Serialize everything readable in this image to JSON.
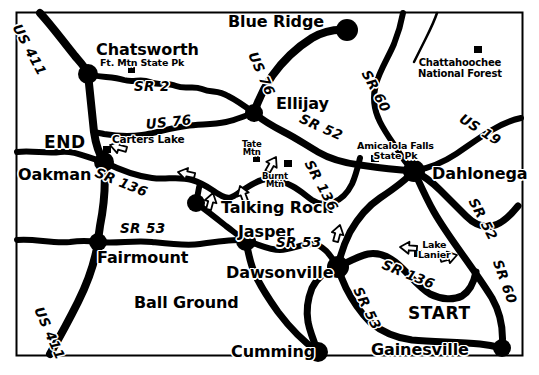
{
  "map": {
    "title": "North Georgia Route Map",
    "style": "black-and-white line map",
    "border_color": "#000000",
    "background_color": "#ffffff",
    "ink_color": "#000000",
    "frame": {
      "x": 16,
      "y": 12,
      "width": 506,
      "height": 343
    },
    "cities": [
      {
        "name": "Blue Ridge",
        "x": 228,
        "y": 14,
        "size": "city-lg",
        "dot": true,
        "dot_x": 347,
        "dot_y": 30,
        "dot_r": 11
      },
      {
        "name": "Chatsworth",
        "x": 96,
        "y": 42,
        "size": "city-lg",
        "dot": true,
        "dot_x": 88,
        "dot_y": 74,
        "dot_r": 10
      },
      {
        "name": "Ellijay",
        "x": 276,
        "y": 96,
        "size": "city-lg",
        "dot": true,
        "dot_x": 254,
        "dot_y": 113,
        "dot_r": 9
      },
      {
        "name": "Dahlonega",
        "x": 432,
        "y": 166,
        "size": "city-lg",
        "dot": true,
        "dot_x": 414,
        "dot_y": 171,
        "dot_r": 11
      },
      {
        "name": "Oakman",
        "x": 18,
        "y": 167,
        "size": "city-lg",
        "dot": true,
        "dot_x": 104,
        "dot_y": 162,
        "dot_r": 10
      },
      {
        "name": "Talking Rock",
        "x": 221,
        "y": 200,
        "size": "city-lg",
        "dot": true,
        "dot_x": 196,
        "dot_y": 203,
        "dot_r": 9
      },
      {
        "name": "Jasper",
        "x": 238,
        "y": 224,
        "size": "city-lg",
        "dot": true,
        "dot_x": 246,
        "dot_y": 241,
        "dot_r": 10
      },
      {
        "name": "Fairmount",
        "x": 97,
        "y": 250,
        "size": "city-lg",
        "dot": true,
        "dot_x": 98,
        "dot_y": 242,
        "dot_r": 9
      },
      {
        "name": "Dawsonville",
        "x": 226,
        "y": 265,
        "size": "city-lg",
        "dot": true,
        "dot_x": 338,
        "dot_y": 267,
        "dot_r": 11
      },
      {
        "name": "Ball Ground",
        "x": 134,
        "y": 295,
        "size": "city-lg",
        "dot": false,
        "dot_x": 0,
        "dot_y": 0,
        "dot_r": 0
      },
      {
        "name": "Cumming",
        "x": 231,
        "y": 344,
        "size": "city-lg",
        "dot": true,
        "dot_x": 318,
        "dot_y": 352,
        "dot_r": 10
      },
      {
        "name": "Gainesville",
        "x": 371,
        "y": 342,
        "size": "city-lg",
        "dot": true,
        "dot_x": 502,
        "dot_y": 348,
        "dot_r": 9
      }
    ],
    "route_labels": [
      {
        "text": "US 411",
        "x": 22,
        "y": 22,
        "rotate": 62,
        "cls": "route"
      },
      {
        "text": "SR 2",
        "x": 134,
        "y": 80,
        "rotate": 0,
        "cls": "route"
      },
      {
        "text": "US 76",
        "x": 145,
        "y": 118,
        "rotate": -6,
        "cls": "route"
      },
      {
        "text": "US 76",
        "x": 258,
        "y": 50,
        "rotate": 66,
        "cls": "route"
      },
      {
        "text": "SR 136",
        "x": 98,
        "y": 166,
        "rotate": 22,
        "cls": "route"
      },
      {
        "text": "SR 52",
        "x": 303,
        "y": 112,
        "rotate": 24,
        "cls": "route"
      },
      {
        "text": "SR 60",
        "x": 371,
        "y": 68,
        "rotate": 62,
        "cls": "route"
      },
      {
        "text": "US 19",
        "x": 464,
        "y": 112,
        "rotate": 32,
        "cls": "route"
      },
      {
        "text": "SR 136",
        "x": 314,
        "y": 158,
        "rotate": 62,
        "cls": "route"
      },
      {
        "text": "SR 53",
        "x": 120,
        "y": 222,
        "rotate": 0,
        "cls": "route"
      },
      {
        "text": "SR 53",
        "x": 276,
        "y": 236,
        "rotate": 0,
        "cls": "route"
      },
      {
        "text": "SR 52",
        "x": 478,
        "y": 196,
        "rotate": 62,
        "cls": "route"
      },
      {
        "text": "SR 136",
        "x": 385,
        "y": 258,
        "rotate": 22,
        "cls": "route"
      },
      {
        "text": "SR 53",
        "x": 363,
        "y": 285,
        "rotate": 64,
        "cls": "route"
      },
      {
        "text": "SR 60",
        "x": 503,
        "y": 258,
        "rotate": 70,
        "cls": "route"
      },
      {
        "text": "US 411",
        "x": 44,
        "y": 305,
        "rotate": 66,
        "cls": "route"
      }
    ],
    "markers": [
      {
        "label": "Ft. Mtn State Pk",
        "label_x": 100,
        "label_y": 58,
        "cls": "park",
        "sq_x": 128,
        "sq_y": 67,
        "sq_w": 7,
        "sq_h": 6
      },
      {
        "label": "Carters Lake",
        "label_x": 112,
        "label_y": 134,
        "cls": "park2",
        "sq_x": 103,
        "sq_y": 146,
        "sq_w": 8,
        "sq_h": 7
      },
      {
        "label": "Tate\nMtn",
        "label_x": 242,
        "label_y": 140,
        "cls": "mtn",
        "sq_x": 253,
        "sq_y": 156,
        "sq_w": 7,
        "sq_h": 6
      },
      {
        "label": "Burnt\nMtn",
        "label_x": 262,
        "label_y": 172,
        "cls": "mtn",
        "sq_x": 284,
        "sq_y": 160,
        "sq_w": 8,
        "sq_h": 7
      },
      {
        "label": "Amicalola Falls\nState Pk",
        "label_x": 357,
        "label_y": 141,
        "cls": "lake",
        "sq_x": 371,
        "sq_y": 155,
        "sq_w": 8,
        "sq_h": 7
      },
      {
        "label": "Chattahoochee\nNational Forest",
        "label_x": 418,
        "label_y": 57,
        "cls": "forest",
        "sq_x": 474,
        "sq_y": 46,
        "sq_w": 8,
        "sq_h": 7
      },
      {
        "label": "Lake\nLanier",
        "label_x": 418,
        "label_y": 240,
        "cls": "lake",
        "sq_x": 414,
        "sq_y": 250,
        "sq_w": 8,
        "sq_h": 7
      }
    ],
    "termini": [
      {
        "text": "END",
        "x": 44,
        "y": 134
      },
      {
        "text": "START",
        "x": 408,
        "y": 305
      }
    ],
    "direction_arrows": [
      {
        "x": 110,
        "y": 145,
        "rotate": 195
      },
      {
        "x": 178,
        "y": 172,
        "rotate": 192
      },
      {
        "x": 240,
        "y": 186,
        "rotate": 250
      },
      {
        "x": 276,
        "y": 157,
        "rotate": 300
      },
      {
        "x": 213,
        "y": 193,
        "rotate": 285
      },
      {
        "x": 340,
        "y": 225,
        "rotate": 285
      },
      {
        "x": 400,
        "y": 247,
        "rotate": 185
      },
      {
        "x": 457,
        "y": 255,
        "rotate": 345
      }
    ]
  }
}
